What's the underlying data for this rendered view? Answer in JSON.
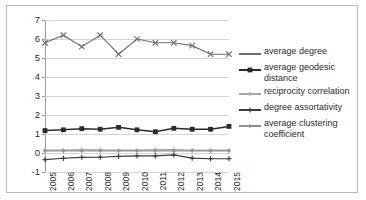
{
  "chart_data": {
    "type": "line",
    "title": "",
    "xlabel": "",
    "ylabel": "",
    "ylim": [
      -1,
      7
    ],
    "ytick_step": 1,
    "yticks": [
      "7",
      "6",
      "5",
      "4",
      "3",
      "2",
      "1",
      "0",
      "-1"
    ],
    "grid": true,
    "legend_position": "right",
    "categories": [
      "2005",
      "2006",
      "2007",
      "2008",
      "2009",
      "2010",
      "2011",
      "2012",
      "2013",
      "2014",
      "2015"
    ],
    "series": [
      {
        "name": "average degree",
        "marker": "x-cross",
        "color": "#6e6e6e",
        "values": [
          5.8,
          6.2,
          5.6,
          6.2,
          5.2,
          6.0,
          5.8,
          5.8,
          5.65,
          5.2,
          5.2
        ]
      },
      {
        "name": "average geodesic distance",
        "marker": "filled-square",
        "color": "#2b2b2b",
        "values": [
          1.18,
          1.22,
          1.28,
          1.25,
          1.35,
          1.22,
          1.12,
          1.3,
          1.25,
          1.25,
          1.4
        ]
      },
      {
        "name": "reciprocity correlation",
        "marker": "small-plus",
        "color": "#a6a6a6",
        "values": [
          0.16,
          0.16,
          0.18,
          0.17,
          0.15,
          0.15,
          0.18,
          0.18,
          0.16,
          0.15,
          0.15
        ]
      },
      {
        "name": "degree assortativity",
        "marker": "plus",
        "color": "#3c3c3c",
        "values": [
          -0.35,
          -0.28,
          -0.23,
          -0.22,
          -0.18,
          -0.15,
          -0.15,
          -0.1,
          -0.27,
          -0.3,
          -0.3
        ]
      },
      {
        "name": "average clustering coefficient",
        "marker": "small-plus",
        "color": "#8f8f8f",
        "values": [
          0.11,
          0.11,
          0.11,
          0.11,
          0.11,
          0.11,
          0.11,
          0.11,
          0.11,
          0.11,
          0.11
        ]
      }
    ]
  },
  "legend": {
    "items": [
      {
        "label": "average degree"
      },
      {
        "label": "average geodesic distance"
      },
      {
        "label": "reciprocity correlation"
      },
      {
        "label": "degree assortativity"
      },
      {
        "label": "average clustering coefficient"
      }
    ]
  },
  "colors": {
    "grid": "#d3d3d3",
    "axis": "#9a9a9a",
    "text": "#2b2b2b",
    "border": "#b9b9b9",
    "background": "#ffffff"
  }
}
